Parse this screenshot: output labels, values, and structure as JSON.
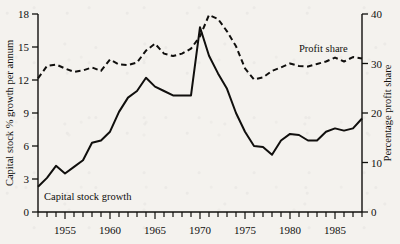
{
  "figure": {
    "background_color": "#f4f2ee",
    "ink_color": "#100f0d"
  },
  "axes": {
    "left": {
      "title": "Capital stock % growth per annum",
      "ticks": [
        "0",
        "3",
        "6",
        "9",
        "12",
        "15",
        "18"
      ],
      "min": 0,
      "max": 18
    },
    "right": {
      "title": "Percentage profit share",
      "ticks": [
        "0",
        "10",
        "20",
        "30",
        "40"
      ],
      "min": 0,
      "max": 40
    },
    "bottom": {
      "title": "",
      "ticks": [
        "1955",
        "1960",
        "1965",
        "1970",
        "1975",
        "1980",
        "1985"
      ],
      "tick_years": [
        1955,
        1960,
        1965,
        1970,
        1975,
        1980,
        1985
      ],
      "min": 1952,
      "max": 1988,
      "minor_tick_step": 1
    }
  },
  "annotations": {
    "capital_stock_label": "Capital stock growth",
    "profit_share_label": "Profit share"
  },
  "chart_data": {
    "type": "line",
    "title": "",
    "xlabel": "",
    "ylabel": "Capital stock % growth per annum",
    "y2label": "Percentage profit share",
    "xlim": [
      1952,
      1988
    ],
    "ylim": [
      0,
      18
    ],
    "y2lim": [
      0,
      40
    ],
    "grid": false,
    "legend": "inline-annotations",
    "x": [
      1952,
      1953,
      1954,
      1955,
      1956,
      1957,
      1958,
      1959,
      1960,
      1961,
      1962,
      1963,
      1964,
      1965,
      1966,
      1967,
      1968,
      1969,
      1970,
      1971,
      1972,
      1973,
      1974,
      1975,
      1976,
      1977,
      1978,
      1979,
      1980,
      1981,
      1982,
      1983,
      1984,
      1985,
      1986,
      1987,
      1988
    ],
    "series": [
      {
        "name": "Capital stock growth",
        "axis": "left",
        "style": "solid",
        "units": "% growth per annum",
        "values": [
          2.3,
          3.1,
          4.2,
          3.5,
          4.1,
          4.7,
          6.3,
          6.5,
          7.3,
          9.1,
          10.4,
          11.0,
          12.2,
          11.4,
          11.0,
          10.6,
          10.6,
          10.6,
          16.8,
          14.2,
          12.6,
          11.2,
          9.0,
          7.3,
          6.0,
          5.9,
          5.2,
          6.5,
          7.1,
          7.0,
          6.5,
          6.5,
          7.3,
          7.6,
          7.4,
          7.6,
          8.5
        ]
      },
      {
        "name": "Profit share",
        "axis": "right",
        "style": "dashed",
        "units": "percentage profit share",
        "values": [
          27.0,
          29.5,
          29.8,
          29.0,
          28.3,
          28.6,
          29.2,
          28.5,
          30.8,
          29.8,
          29.7,
          30.2,
          32.6,
          34.0,
          32.0,
          31.5,
          32.0,
          33.0,
          35.5,
          39.8,
          39.0,
          36.5,
          33.5,
          29.0,
          26.8,
          27.2,
          28.5,
          29.2,
          30.0,
          29.5,
          29.4,
          29.9,
          30.4,
          31.2,
          30.4,
          31.3,
          31.0
        ]
      }
    ]
  }
}
